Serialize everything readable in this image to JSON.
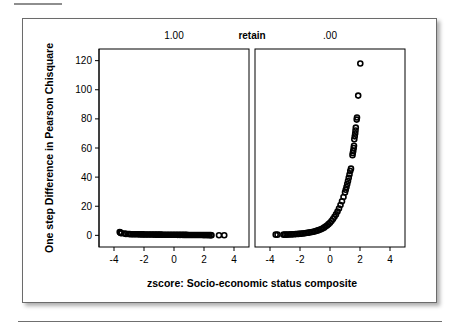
{
  "figure": {
    "x_axis_title": "zscore: Socio-economic status composite",
    "y_axis_title": "One step Difference in Pearson Chisquare",
    "strip_group_label": "retain",
    "panels": [
      {
        "label": "1.00"
      },
      {
        "label": ".00"
      }
    ]
  },
  "chart_data": {
    "type": "scatter",
    "title": "",
    "subtitle": "",
    "xlabel": "zscore: Socio-economic status composite",
    "ylabel": "One step Difference in Pearson Chisquare",
    "xlim": [
      -5,
      5
    ],
    "ylim": [
      -8,
      128
    ],
    "xticks": [
      -4,
      -2,
      0,
      2,
      4
    ],
    "yticks": [
      0,
      20,
      40,
      60,
      80,
      100,
      120
    ],
    "xtick_labels": [
      "-4",
      "-2",
      "0",
      "2",
      "4"
    ],
    "ytick_labels": [
      "0",
      "20",
      "40",
      "60",
      "80",
      "100",
      "120"
    ],
    "grid": false,
    "legend": "none",
    "panel_variable": "retain",
    "marker": "open-circle",
    "marker_color": "#000000",
    "panels": [
      {
        "name": "1.00",
        "strip_label": "1.00",
        "description": "Nearly flat band of points close to zero across the full zscore range, with a small cluster of slightly elevated points near the left edge and two isolated points at the far right.",
        "points": [
          [
            -3.62,
            2.3
          ],
          [
            -3.58,
            2.0
          ],
          [
            -3.55,
            1.7
          ],
          [
            -3.5,
            1.4
          ],
          [
            -3.3,
            1.2
          ],
          [
            -3.2,
            1.0
          ],
          [
            -3.05,
            0.9
          ],
          [
            -2.95,
            0.85
          ],
          [
            -2.85,
            0.8
          ],
          [
            -2.75,
            0.78
          ],
          [
            -2.65,
            0.76
          ],
          [
            -2.55,
            0.74
          ],
          [
            -2.45,
            0.72
          ],
          [
            -2.35,
            0.7
          ],
          [
            -2.25,
            0.68
          ],
          [
            -2.15,
            0.66
          ],
          [
            -2.05,
            0.64
          ],
          [
            -1.95,
            0.62
          ],
          [
            -1.85,
            0.6
          ],
          [
            -1.75,
            0.58
          ],
          [
            -1.65,
            0.56
          ],
          [
            -1.55,
            0.55
          ],
          [
            -1.45,
            0.54
          ],
          [
            -1.35,
            0.52
          ],
          [
            -1.25,
            0.51
          ],
          [
            -1.15,
            0.5
          ],
          [
            -1.05,
            0.49
          ],
          [
            -0.95,
            0.48
          ],
          [
            -0.85,
            0.47
          ],
          [
            -0.75,
            0.46
          ],
          [
            -0.65,
            0.45
          ],
          [
            -0.55,
            0.44
          ],
          [
            -0.45,
            0.43
          ],
          [
            -0.35,
            0.42
          ],
          [
            -0.25,
            0.41
          ],
          [
            -0.15,
            0.4
          ],
          [
            -0.05,
            0.39
          ],
          [
            0.05,
            0.38
          ],
          [
            0.15,
            0.37
          ],
          [
            0.25,
            0.36
          ],
          [
            0.35,
            0.35
          ],
          [
            0.45,
            0.34
          ],
          [
            0.55,
            0.33
          ],
          [
            0.65,
            0.32
          ],
          [
            0.75,
            0.31
          ],
          [
            0.85,
            0.3
          ],
          [
            0.95,
            0.29
          ],
          [
            1.05,
            0.28
          ],
          [
            1.15,
            0.27
          ],
          [
            1.25,
            0.26
          ],
          [
            1.35,
            0.25
          ],
          [
            1.45,
            0.24
          ],
          [
            1.55,
            0.23
          ],
          [
            1.65,
            0.22
          ],
          [
            1.75,
            0.21
          ],
          [
            1.85,
            0.2
          ],
          [
            1.95,
            0.19
          ],
          [
            2.05,
            0.18
          ],
          [
            2.15,
            0.17
          ],
          [
            2.25,
            0.16
          ],
          [
            2.35,
            0.15
          ],
          [
            2.45,
            0.14
          ],
          [
            2.5,
            0.12
          ],
          [
            3.0,
            0.1
          ],
          [
            3.35,
            0.1
          ]
        ]
      },
      {
        "name": ".00",
        "strip_label": ".00",
        "description": "Points rise exponentially with zscore: flat near zero below zscore 0, then sharply increasing past zscore 1, reaching about 45 at zscore 1.4, with a broken band between 55 and 75 near zscore 1.6, and isolated high outliers at about 80, 96 and 118.",
        "points": [
          [
            -3.62,
            0.5
          ],
          [
            -3.5,
            0.5
          ],
          [
            -3.1,
            0.5
          ],
          [
            -3.0,
            0.5
          ],
          [
            -2.9,
            0.5
          ],
          [
            -2.8,
            0.6
          ],
          [
            -2.7,
            0.6
          ],
          [
            -2.6,
            0.7
          ],
          [
            -2.5,
            0.7
          ],
          [
            -2.4,
            0.8
          ],
          [
            -2.3,
            0.85
          ],
          [
            -2.2,
            0.9
          ],
          [
            -2.1,
            1.0
          ],
          [
            -2.0,
            1.1
          ],
          [
            -1.9,
            1.2
          ],
          [
            -1.8,
            1.3
          ],
          [
            -1.7,
            1.45
          ],
          [
            -1.6,
            1.6
          ],
          [
            -1.5,
            1.75
          ],
          [
            -1.4,
            1.9
          ],
          [
            -1.3,
            2.1
          ],
          [
            -1.2,
            2.3
          ],
          [
            -1.1,
            2.5
          ],
          [
            -1.0,
            2.8
          ],
          [
            -0.9,
            3.1
          ],
          [
            -0.8,
            3.4
          ],
          [
            -0.7,
            3.8
          ],
          [
            -0.6,
            4.2
          ],
          [
            -0.5,
            4.7
          ],
          [
            -0.4,
            5.3
          ],
          [
            -0.3,
            6.0
          ],
          [
            -0.2,
            6.8
          ],
          [
            -0.1,
            7.7
          ],
          [
            0.0,
            8.7
          ],
          [
            0.1,
            9.9
          ],
          [
            0.2,
            11.2
          ],
          [
            0.3,
            12.7
          ],
          [
            0.4,
            14.4
          ],
          [
            0.5,
            16.3
          ],
          [
            0.6,
            18.4
          ],
          [
            0.7,
            20.8
          ],
          [
            0.8,
            23.4
          ],
          [
            0.9,
            26.3
          ],
          [
            1.0,
            29.5
          ],
          [
            1.05,
            31.3
          ],
          [
            1.1,
            33.2
          ],
          [
            1.15,
            35.2
          ],
          [
            1.2,
            37.3
          ],
          [
            1.25,
            39.5
          ],
          [
            1.3,
            41.8
          ],
          [
            1.35,
            44.2
          ],
          [
            1.4,
            45.8
          ],
          [
            1.5,
            55.0
          ],
          [
            1.52,
            56.5
          ],
          [
            1.55,
            58.0
          ],
          [
            1.58,
            60.0
          ],
          [
            1.6,
            61.5
          ],
          [
            1.62,
            66.0
          ],
          [
            1.65,
            68.0
          ],
          [
            1.68,
            70.0
          ],
          [
            1.7,
            72.0
          ],
          [
            1.72,
            74.0
          ],
          [
            1.78,
            79.5
          ],
          [
            1.8,
            81.0
          ],
          [
            1.88,
            96.0
          ],
          [
            2.02,
            118.0
          ]
        ]
      }
    ]
  }
}
